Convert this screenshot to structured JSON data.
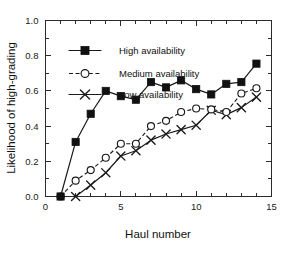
{
  "chart_data": {
    "type": "line",
    "title": "",
    "xlabel": "Haul number",
    "ylabel": "Likelihood of high-grading",
    "xlim": [
      0,
      15
    ],
    "ylim": [
      0,
      1
    ],
    "x_major_ticks": [
      0,
      5,
      10,
      15
    ],
    "x_major_tick_labels": [
      "0",
      "5",
      "10",
      "15"
    ],
    "x_minor_tick_step": 1,
    "y_major_ticks": [
      0,
      0.2,
      0.4,
      0.6,
      0.8,
      1
    ],
    "y_major_tick_labels": [
      "0.0",
      "0.2",
      "0.4",
      "0.6",
      "0.8",
      "1.0"
    ],
    "y_minor_tick_step": 0.1,
    "grid": false,
    "legend_position": "upper left inside",
    "frame": "box",
    "series": [
      {
        "name": "High availability",
        "marker": "filled-square",
        "linestyle": "solid",
        "x": [
          1,
          2,
          3,
          4,
          5,
          6,
          7,
          8,
          9,
          10,
          11,
          12,
          13,
          14
        ],
        "values": [
          0.0,
          0.31,
          0.47,
          0.6,
          0.57,
          0.55,
          0.65,
          0.62,
          0.66,
          0.61,
          0.58,
          0.64,
          0.65,
          0.755
        ]
      },
      {
        "name": "Medium availability",
        "marker": "open-circle",
        "linestyle": "dashed",
        "x": [
          1,
          2,
          3,
          4,
          5,
          6,
          7,
          8,
          9,
          10,
          11,
          12,
          13,
          14
        ],
        "values": [
          0.0,
          0.09,
          0.15,
          0.22,
          0.3,
          0.3,
          0.4,
          0.43,
          0.48,
          0.5,
          0.495,
          0.48,
          0.585,
          0.615
        ]
      },
      {
        "name": "Low availability",
        "marker": "cross",
        "linestyle": "solid",
        "x": [
          2,
          3,
          4,
          5,
          6,
          7,
          8,
          9,
          10,
          11,
          12,
          13,
          14
        ],
        "values": [
          0.0,
          0.065,
          0.135,
          0.23,
          0.26,
          0.32,
          0.355,
          0.38,
          0.405,
          0.49,
          0.465,
          0.505,
          0.565
        ]
      }
    ]
  },
  "legend": {
    "entries": [
      {
        "label": "High availability"
      },
      {
        "label": "Medium availability"
      },
      {
        "label": "Low availability"
      }
    ]
  },
  "colors": {
    "ink": "#1a1a1a",
    "background": "#ffffff"
  }
}
